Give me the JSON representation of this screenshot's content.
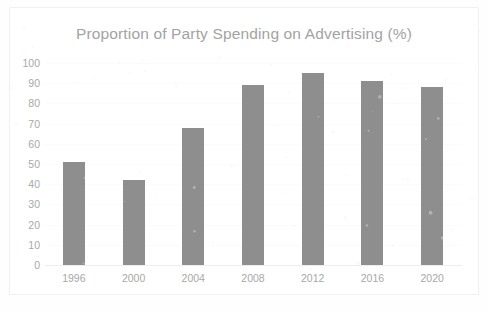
{
  "chart_data": {
    "type": "bar",
    "title": "Proportion of Party Spending on Advertising (%)",
    "xlabel": "",
    "ylabel": "",
    "categories": [
      "1996",
      "2000",
      "2004",
      "2008",
      "2012",
      "2016",
      "2020"
    ],
    "values": [
      51,
      42,
      68,
      89,
      95,
      91,
      88
    ],
    "ylim": [
      0,
      100
    ],
    "yticks": [
      0,
      10,
      20,
      30,
      40,
      50,
      60,
      70,
      80,
      90,
      100
    ],
    "ytick_labels": [
      "0",
      "10",
      "20",
      "30",
      "40",
      "50",
      "60",
      "70",
      "80",
      "90",
      "100"
    ],
    "grid": true,
    "legend": false,
    "bar_color": "#8e8e8e",
    "title_color": "#a3a3a3",
    "tick_label_color": "#a8a8a8",
    "background_color": "#ffffff"
  }
}
